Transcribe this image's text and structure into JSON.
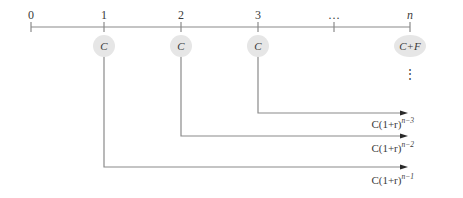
{
  "timeline": {
    "ticks": [
      {
        "label": "0",
        "period": 0
      },
      {
        "label": "1",
        "period": 1
      },
      {
        "label": "2",
        "period": 2
      },
      {
        "label": "3",
        "period": 3
      },
      {
        "label": "…",
        "period": 4
      },
      {
        "label": "n",
        "period": 5
      }
    ],
    "cashflows": [
      {
        "tick": 1,
        "label": "C"
      },
      {
        "tick": 2,
        "label": "C"
      },
      {
        "tick": 3,
        "label": "C"
      },
      {
        "tick": 5,
        "label": "C+F"
      }
    ],
    "vertical_ellipsis": "⋮",
    "future_values": [
      {
        "from_tick": 3,
        "base": "C(1+r)",
        "exponent": "n−3"
      },
      {
        "from_tick": 2,
        "base": "C(1+r)",
        "exponent": "n−2"
      },
      {
        "from_tick": 1,
        "base": "C(1+r)",
        "exponent": "n−1"
      }
    ]
  },
  "colors": {
    "line": "#8a8a8a",
    "bubble": "#e6e6e6",
    "text": "#3a3a3a",
    "arrowhead": "#2a2a2a"
  }
}
